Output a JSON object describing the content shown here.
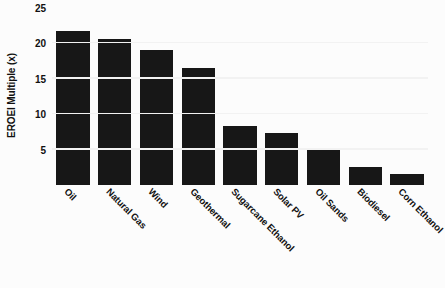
{
  "chart_data": {
    "type": "bar",
    "title": "",
    "subtitle": "",
    "xlabel": "",
    "ylabel": "EROEI Multiple (x)",
    "ylim": [
      0,
      25
    ],
    "yticks": [
      5,
      10,
      15,
      20,
      25
    ],
    "ytick_labels": [
      "5",
      "10",
      "15",
      "20",
      "25"
    ],
    "grid": "horizontal",
    "legend": "none",
    "bar_color": "#171717",
    "gridline_color": "#f2f2f2",
    "background_color": "#fcfcfc",
    "categories": [
      "Oil",
      "Natural Gas",
      "Wind",
      "Geothermal",
      "Sugarcane Ethanol",
      "Solar PV",
      "Oil Sands",
      "Biodiesel",
      "Corn Ethanol"
    ],
    "values": [
      21.8,
      20.6,
      19.0,
      16.5,
      8.4,
      7.3,
      5.2,
      2.5,
      1.5
    ],
    "series": [
      {
        "name": "EROEI Multiple (x)",
        "values": [
          21.8,
          20.6,
          19.0,
          16.5,
          8.4,
          7.3,
          5.2,
          2.5,
          1.5
        ]
      }
    ]
  }
}
